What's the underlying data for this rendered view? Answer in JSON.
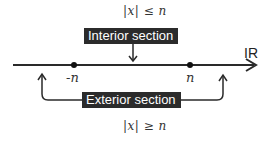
{
  "diagram": {
    "axis": {
      "label": "IR",
      "color": "#2a2a2a"
    },
    "points": [
      {
        "id": "neg_n",
        "label": "-n"
      },
      {
        "id": "pos_n",
        "label": "n"
      }
    ],
    "interior": {
      "label": "Interior section",
      "condition": "|x| ≤ n"
    },
    "exterior": {
      "label": "Exterior section",
      "condition": "|x| ≥ n"
    },
    "colors": {
      "box_fill": "#2b2b2b",
      "box_text": "#ffffff",
      "line": "#2a2a2a",
      "background": "#ffffff"
    }
  }
}
